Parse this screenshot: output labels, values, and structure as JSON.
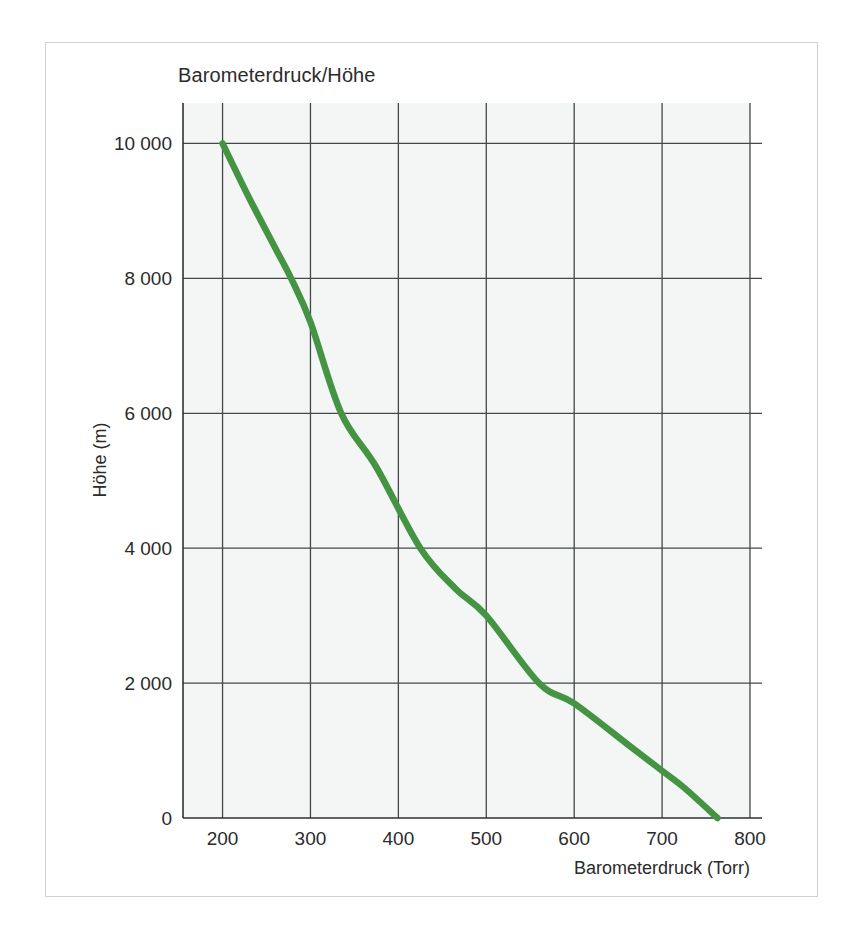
{
  "figure": {
    "title": "Barometerdruck/Höhe",
    "background_color": "#ffffff",
    "frame_color": "#cfd2d3",
    "plot_background_color": "#f4f6f6",
    "grid_color": "#44484a"
  },
  "chart_data": {
    "type": "line",
    "title": "Barometerdruck/Höhe",
    "xlabel": "Barometerdruck (Torr)",
    "ylabel": "Höhe (m)",
    "xlim": [
      155,
      800
    ],
    "ylim": [
      0,
      10600
    ],
    "grid": true,
    "legend": null,
    "series_color": "#449444",
    "xticks": [
      200,
      300,
      400,
      500,
      600,
      700,
      800
    ],
    "xtick_labels": [
      "200",
      "300",
      "400",
      "500",
      "600",
      "700",
      "800"
    ],
    "yticks": [
      0,
      2000,
      4000,
      6000,
      8000,
      10000
    ],
    "ytick_labels": [
      "0",
      "2 000",
      "4 000",
      "6 000",
      "8 000",
      "10 000"
    ],
    "series": [
      {
        "name": "Barometerdruck vs. Höhe",
        "x": [
          200,
          230,
          262,
          278,
          300,
          335,
          375,
          425,
          465,
          500,
          560,
          600,
          660,
          700,
          725,
          763
        ],
        "y": [
          10000,
          9200,
          8400,
          8000,
          7350,
          6000,
          5200,
          4000,
          3400,
          3000,
          2000,
          1700,
          1100,
          700,
          450,
          0
        ]
      }
    ]
  },
  "axis_labels": {
    "x_axis_title": "Barometerdruck (Torr)",
    "y_axis_title": "Höhe (m)"
  }
}
